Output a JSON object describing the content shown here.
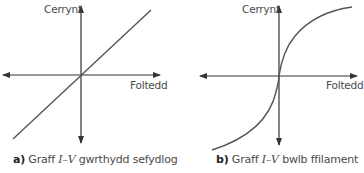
{
  "graphs": [
    {
      "id": "a",
      "y_axis_label": "Cerrynt",
      "x_axis_label": "Foltedd",
      "caption_letter": "a)",
      "caption_prefix": "Graff",
      "caption_italic": "I–V",
      "caption_suffix": "gwrthydd sefydlog",
      "curve_type": "straight line through origin"
    },
    {
      "id": "b",
      "y_axis_label": "Cerrynt",
      "x_axis_label": "Foltedd",
      "caption_letter": "b)",
      "caption_prefix": "Graff",
      "caption_italic": "I–V",
      "caption_suffix": "bwlb ffilament",
      "curve_type": "S-shaped curve through origin, flattening at high voltage"
    }
  ],
  "colors": {
    "line": "#555555",
    "axis": "#333333",
    "text": "#4a4a4a"
  }
}
